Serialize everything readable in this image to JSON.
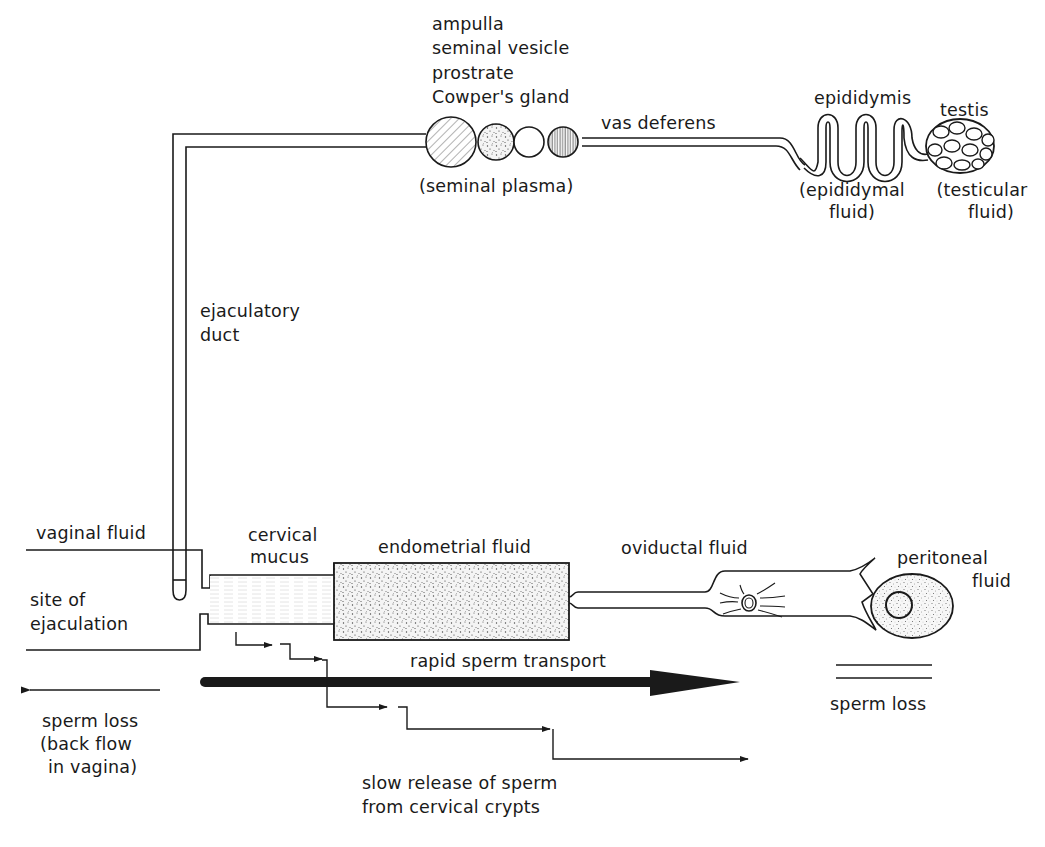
{
  "diagram": {
    "title": "",
    "male_tract": {
      "glands_label_lines": [
        "ampulla",
        "seminal vesicle",
        "prostrate",
        "Cowper's gland"
      ],
      "glands_fluid": "(seminal plasma)",
      "vas_deferens": "vas deferens",
      "epididymis": "epididymis",
      "epididymis_fluid_lines": [
        "(epididymal",
        "fluid)"
      ],
      "testis": "testis",
      "testis_fluid_lines": [
        "(testicular",
        "fluid)"
      ],
      "ejaculatory_duct_lines": [
        "ejaculatory",
        "duct"
      ]
    },
    "female_tract": {
      "vaginal_fluid": "vaginal fluid",
      "site_of_ejaculation_lines": [
        "site of",
        "ejaculation"
      ],
      "cervical_mucus_lines": [
        "cervical",
        "mucus"
      ],
      "endometrial_fluid": "endometrial fluid",
      "oviductal_fluid": "oviductal fluid",
      "peritoneal_fluid_lines": [
        "peritoneal",
        "fluid"
      ]
    },
    "transport": {
      "rapid": "rapid sperm transport",
      "slow_lines": [
        "slow release of sperm",
        "from cervical crypts"
      ],
      "loss_right": "sperm loss",
      "loss_left_lines": [
        "sperm loss",
        "(back flow",
        "in vagina)"
      ]
    },
    "colors": {
      "ink": "#1a1a1a",
      "background": "#ffffff",
      "stipple": "#555555"
    }
  }
}
